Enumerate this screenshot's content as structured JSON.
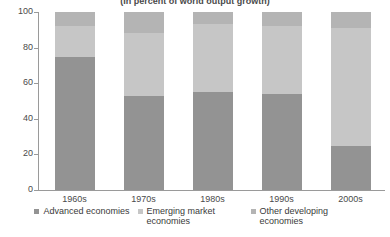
{
  "chart_data": {
    "type": "bar",
    "stacked": true,
    "stack_mode": "percent",
    "title": "(In percent of world output growth)",
    "xlabel": "",
    "ylabel": "",
    "ylim": [
      0,
      100
    ],
    "yticks": [
      0,
      20,
      40,
      60,
      80,
      100
    ],
    "grid": false,
    "legend_position": "bottom",
    "categories": [
      "1960s",
      "1970s",
      "1980s",
      "1990s",
      "2000s"
    ],
    "series": [
      {
        "name": "Advanced economies",
        "color": "#939393",
        "values": [
          75,
          53,
          55,
          54,
          25
        ]
      },
      {
        "name": "Emerging market economies",
        "color": "#c6c6c6",
        "values": [
          17,
          35,
          38,
          38,
          66
        ]
      },
      {
        "name": "Other developing economies",
        "color": "#b4b4b4",
        "values": [
          8,
          12,
          7,
          8,
          9
        ]
      }
    ],
    "cumulative_tops": [
      [
        75,
        92,
        100
      ],
      [
        53,
        88,
        100
      ],
      [
        55,
        93,
        100
      ],
      [
        54,
        92,
        100
      ],
      [
        25,
        91,
        100
      ]
    ]
  },
  "axis": {
    "y_tick_labels": [
      "100",
      "80",
      "60",
      "40",
      "20",
      "0"
    ]
  },
  "legend": {
    "items": [
      {
        "label": "Advanced economies",
        "color": "#939393"
      },
      {
        "label": "Emerging market economies",
        "color": "#c6c6c6"
      },
      {
        "label": "Other developing economies",
        "color": "#b4b4b4"
      }
    ]
  }
}
